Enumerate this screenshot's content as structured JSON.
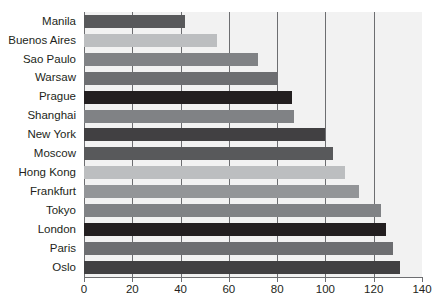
{
  "chart_data": {
    "type": "bar",
    "orientation": "horizontal",
    "title": "",
    "subtitle": "",
    "xlabel": "",
    "ylabel": "",
    "xlim": [
      0,
      140
    ],
    "xticks": [
      0,
      20,
      40,
      60,
      80,
      100,
      120,
      140
    ],
    "grid": true,
    "legend": null,
    "categories": [
      "Manila",
      "Buenos Aires",
      "Sao Paulo",
      "Warsaw",
      "Prague",
      "Shanghai",
      "New York",
      "Moscow",
      "Hong Kong",
      "Frankfurt",
      "Tokyo",
      "London",
      "Paris",
      "Oslo"
    ],
    "values": [
      42,
      55,
      72,
      80,
      86,
      87,
      100,
      103,
      108,
      114,
      123,
      125,
      128,
      131
    ],
    "bar_colors": [
      "#58595b",
      "#bcbec0",
      "#808285",
      "#6d6e71",
      "#231f20",
      "#808285",
      "#414042",
      "#58595b",
      "#bcbec0",
      "#939598",
      "#808285",
      "#231f20",
      "#6d6e71",
      "#414042"
    ],
    "plot_background": "#f2f2f2",
    "gridline_color": "#6d6e71",
    "axis_color": "#6d6e71",
    "text_color": "#231f20"
  }
}
